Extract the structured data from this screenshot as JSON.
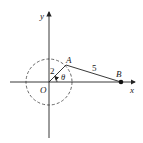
{
  "diagram": {
    "axes": {
      "x_label": "x",
      "y_label": "y"
    },
    "points": {
      "origin": {
        "label": "O"
      },
      "A": {
        "label": "A"
      },
      "B": {
        "label": "B"
      }
    },
    "segments": {
      "OA_length": "2",
      "AB_length": "5"
    },
    "angle": {
      "label": "θ"
    },
    "circle": {
      "style": "dashed"
    },
    "colors": {
      "ink": "#222222",
      "background": "#ffffff"
    }
  }
}
